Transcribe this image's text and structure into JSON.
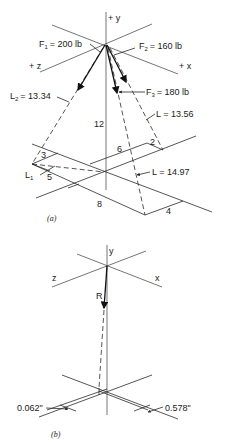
{
  "figure_a": {
    "caption": "(a)",
    "axes": {
      "y": "+ y",
      "z": "+ z",
      "x": "+ x"
    },
    "forces": [
      {
        "name": "F",
        "sub": "1",
        "value": "= 200 lb"
      },
      {
        "name": "F",
        "sub": "2",
        "value": "= 160 lb"
      },
      {
        "name": "F",
        "sub": "3",
        "value": "= 180 lb"
      }
    ],
    "lengths": {
      "L2": {
        "name": "L",
        "sub": "2",
        "value": "= 13.34"
      },
      "L1": {
        "name": "L",
        "sub": "1"
      },
      "L_right": "L = 13.56",
      "L_center": "L = 14.97"
    },
    "dimensions": {
      "height": "12",
      "d3": "3",
      "d5": "5",
      "d6": "6",
      "d2": "2",
      "d8": "8",
      "d4": "4"
    }
  },
  "figure_b": {
    "caption": "(b)",
    "axes": {
      "y": "y",
      "z": "z",
      "x": "x"
    },
    "resultant": "R",
    "offset_left": "0.062\"",
    "offset_right": "0.578\""
  }
}
